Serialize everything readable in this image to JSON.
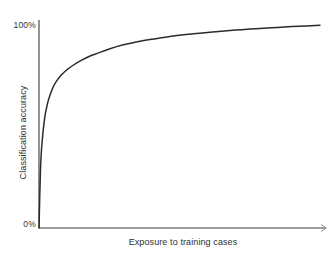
{
  "chart_data": {
    "type": "line",
    "title": "",
    "subtitle": "",
    "xlabel": "Exposure to training cases",
    "ylabel": "Classification accuracy",
    "xlim": [
      0,
      100
    ],
    "ylim": [
      0,
      100
    ],
    "grid": false,
    "legend": false,
    "legend_position": "none",
    "x_tick_labels": [],
    "y_tick_labels": [
      "0%",
      "100%"
    ],
    "y_tick_values": [
      0,
      100
    ],
    "annotations": [],
    "series": [
      {
        "name": "Learning curve",
        "color": "#2b2b2b",
        "x": [
          0,
          0.5,
          1,
          2,
          3,
          4,
          5,
          6,
          8,
          10,
          12,
          15,
          18,
          21,
          25,
          30,
          35,
          40,
          45,
          50,
          55,
          60,
          65,
          70,
          75,
          80,
          85,
          90,
          95,
          100
        ],
        "values": [
          0,
          27,
          40,
          53,
          60,
          64.5,
          68,
          70.5,
          74,
          76.5,
          78.5,
          81,
          83,
          84.5,
          86.5,
          88.5,
          90,
          91.2,
          92.2,
          93.1,
          93.8,
          94.5,
          95.1,
          95.6,
          96.1,
          96.5,
          96.9,
          97.3,
          97.6,
          98
        ]
      }
    ]
  },
  "axes": {
    "x_axis_name": "x-axis",
    "y_axis_name": "y-axis",
    "x_axis_arrow": "arrow-right"
  }
}
